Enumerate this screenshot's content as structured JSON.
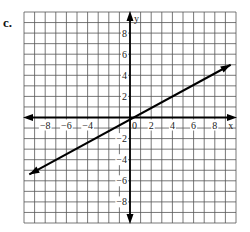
{
  "problem_label": "c.",
  "chart_data": {
    "type": "line",
    "title": "",
    "xlabel": "x",
    "ylabel": "y",
    "xlim": [
      -10,
      10
    ],
    "ylim": [
      -10,
      10
    ],
    "grid": true,
    "x_ticks": [
      -8,
      -6,
      -4,
      2,
      4,
      6,
      8
    ],
    "y_ticks": [
      8,
      6,
      4,
      2,
      -2,
      -4,
      -6,
      -8
    ],
    "origin_label": "0",
    "series": [
      {
        "name": "line",
        "points": [
          [
            -9.5,
            -5.4
          ],
          [
            9.5,
            5.0
          ]
        ],
        "arrows": "both"
      }
    ]
  }
}
